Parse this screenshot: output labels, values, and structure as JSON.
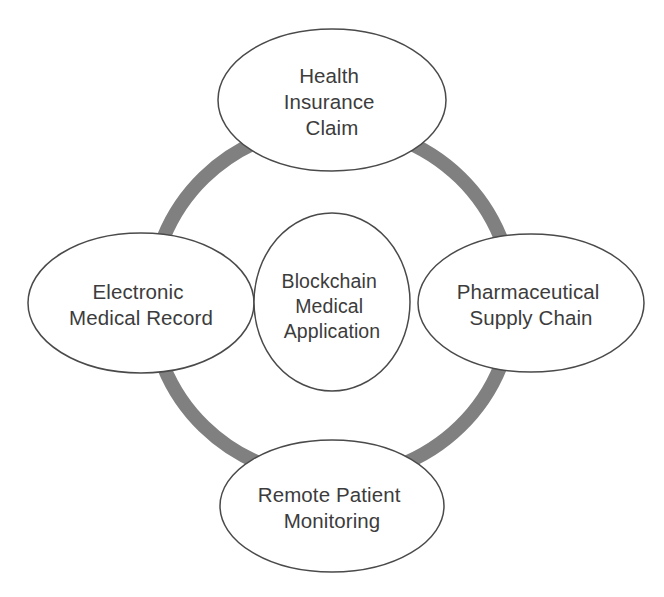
{
  "diagram": {
    "type": "cycle-hub-and-spoke",
    "title": "Blockchain Medical Application",
    "colors": {
      "ring": "#808080",
      "ellipse_outline": "#4a4a4a",
      "ellipse_fill": "#ffffff",
      "text": "#3c3c3c",
      "background": "#ffffff"
    },
    "hub": {
      "name": "blockchain-medical-application",
      "lines": [
        "Blockchain",
        "Medical",
        "Application"
      ],
      "cx": 332,
      "cy": 302,
      "rx": 78,
      "ry": 89
    },
    "ring": {
      "cx": 332,
      "cy": 302,
      "rx": 181,
      "ry": 176,
      "stroke_width": 14
    },
    "nodes": [
      {
        "name": "health-insurance-claim",
        "position": "top",
        "lines": [
          "Health",
          "Insurance",
          "Claim"
        ],
        "cx": 332,
        "cy": 100,
        "rx": 114,
        "ry": 71
      },
      {
        "name": "pharmaceutical-supply-chain",
        "position": "right",
        "lines": [
          "Pharmaceutical",
          "Supply Chain"
        ],
        "cx": 531,
        "cy": 303,
        "rx": 113,
        "ry": 69
      },
      {
        "name": "remote-patient-monitoring",
        "position": "bottom",
        "lines": [
          "Remote Patient",
          "Monitoring"
        ],
        "cx": 332,
        "cy": 506,
        "rx": 112,
        "ry": 66
      },
      {
        "name": "electronic-medical-record",
        "position": "left",
        "lines": [
          "Electronic",
          "Medical Record"
        ],
        "cx": 141,
        "cy": 303,
        "rx": 113,
        "ry": 70
      }
    ]
  }
}
